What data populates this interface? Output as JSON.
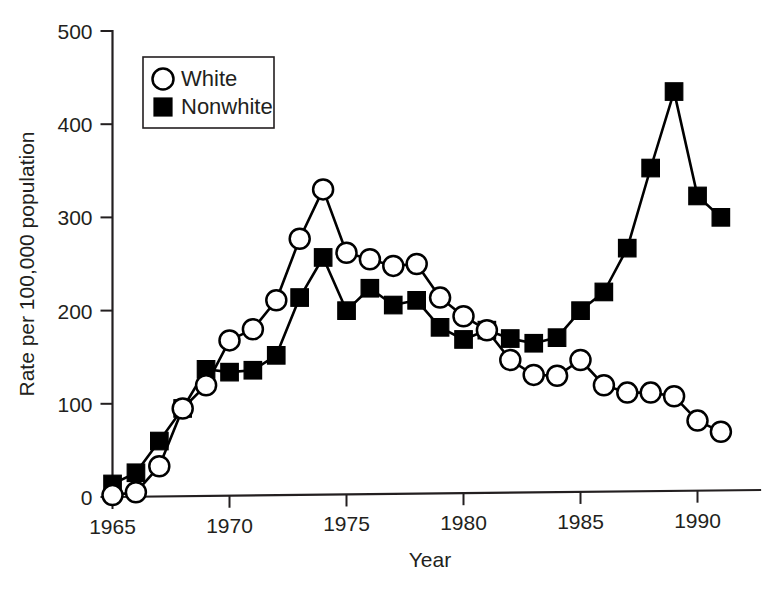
{
  "chart_data": {
    "type": "line",
    "title": "",
    "xlabel": "Year",
    "ylabel": "Rate per 100,000 population",
    "xlim": [
      1964.3,
      1992.0
    ],
    "ylim": [
      0,
      500
    ],
    "grid": false,
    "legend_position": "top-left",
    "x_ticks": [
      1965,
      1970,
      1975,
      1980,
      1985,
      1990
    ],
    "x_tick_labels": [
      "1965",
      "1970",
      "1975",
      "1980",
      "1985",
      "1990"
    ],
    "y_ticks": [
      0,
      100,
      200,
      300,
      400,
      500
    ],
    "y_tick_labels": [
      "0",
      "100",
      "200",
      "300",
      "400",
      "500"
    ],
    "x": [
      1965,
      1966,
      1967,
      1968,
      1969,
      1970,
      1971,
      1972,
      1973,
      1974,
      1975,
      1976,
      1977,
      1978,
      1979,
      1980,
      1981,
      1982,
      1983,
      1984,
      1985,
      1986,
      1987,
      1988,
      1989,
      1990,
      1991
    ],
    "series": [
      {
        "name": "White",
        "marker": "open-circle",
        "values": [
          2,
          5,
          33,
          95,
          120,
          168,
          180,
          211,
          277,
          330,
          262,
          255,
          248,
          250,
          214,
          194,
          179,
          147,
          131,
          130,
          147,
          120,
          112,
          112,
          108,
          82,
          70
        ]
      },
      {
        "name": "Nonwhite",
        "marker": "filled-square",
        "values": [
          14,
          26,
          60,
          95,
          137,
          134,
          136,
          152,
          214,
          257,
          200,
          224,
          206,
          211,
          182,
          169,
          179,
          170,
          165,
          171,
          200,
          220,
          267,
          353,
          435,
          323,
          300
        ]
      }
    ],
    "annotations": []
  },
  "legend": {
    "items": [
      {
        "label": "White",
        "marker": "open-circle"
      },
      {
        "label": "Nonwhite",
        "marker": "filled-square"
      }
    ]
  },
  "axes": {
    "y_title": "Rate per 100,000 population",
    "x_title": "Year"
  },
  "colors": {
    "line": "#000000",
    "axis": "#231f20",
    "background": "#ffffff",
    "marker_open_fill": "#ffffff",
    "marker_filled_fill": "#000000"
  }
}
